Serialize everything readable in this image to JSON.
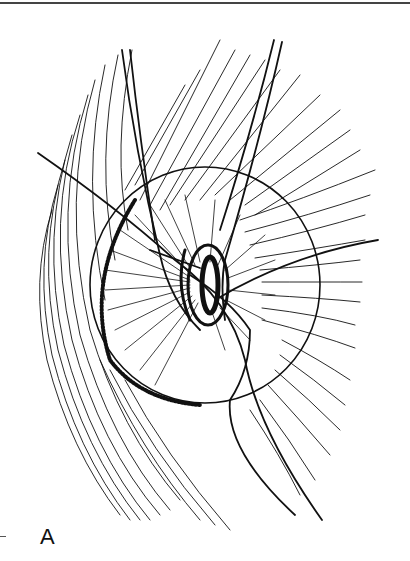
{
  "figure": {
    "label": "A",
    "colors": {
      "ink": "#111111",
      "background": "#ffffff",
      "rule": "#444444"
    }
  }
}
